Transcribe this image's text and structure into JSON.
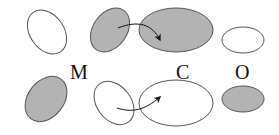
{
  "labels": {
    "m": "M",
    "c": "C",
    "o": "O"
  },
  "colors": {
    "filled": "#b3b3b3",
    "stroke": "#555555",
    "empty": "#ffffff"
  },
  "rows": [
    {
      "name": "top-row",
      "ellipses": [
        {
          "id": "top-left",
          "filled": false
        },
        {
          "id": "top-m",
          "filled": true
        },
        {
          "id": "top-c",
          "filled": true
        },
        {
          "id": "top-o",
          "filled": false
        }
      ],
      "arrow": {
        "from": "top-m",
        "to": "top-c"
      }
    },
    {
      "name": "bottom-row",
      "ellipses": [
        {
          "id": "bottom-left",
          "filled": true
        },
        {
          "id": "bottom-m",
          "filled": false
        },
        {
          "id": "bottom-c",
          "filled": false
        },
        {
          "id": "bottom-o",
          "filled": true
        }
      ],
      "arrow": {
        "from": "bottom-m",
        "to": "bottom-c"
      }
    }
  ]
}
